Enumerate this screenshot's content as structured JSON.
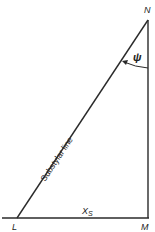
{
  "diagram": {
    "type": "right-triangle",
    "vertices": {
      "N": {
        "label": "N"
      },
      "M": {
        "label": "M"
      },
      "L": {
        "label": "L"
      }
    },
    "hypotenuse_label": "Substylar line",
    "angle_label": "ψ",
    "base_label": "X",
    "base_label_subscript": "S",
    "line_color": "#2a2a2a"
  }
}
